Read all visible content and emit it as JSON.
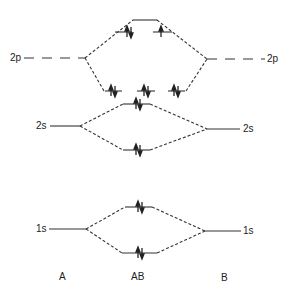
{
  "diagram": {
    "type": "molecular-orbital-energy-diagram",
    "columns": {
      "left": "A",
      "middle": "AB",
      "right": "B"
    },
    "atomic_orbitals": {
      "left": [
        {
          "label": "2p"
        },
        {
          "label": "2s"
        },
        {
          "label": "1s"
        }
      ],
      "right": [
        {
          "label": "2p"
        },
        {
          "label": "2s"
        },
        {
          "label": "1s"
        }
      ]
    },
    "molecular_orbitals": [
      {
        "name": "sigma-star-2p",
        "electrons": 0
      },
      {
        "name": "pi-star-2p-a",
        "electrons": 2
      },
      {
        "name": "pi-star-2p-b",
        "electrons": 1
      },
      {
        "name": "pi-2p-a",
        "electrons": 2
      },
      {
        "name": "sigma-2p",
        "electrons": 2
      },
      {
        "name": "pi-2p-b",
        "electrons": 2
      },
      {
        "name": "sigma-star-2s",
        "electrons": 2
      },
      {
        "name": "sigma-2s",
        "electrons": 2
      },
      {
        "name": "sigma-star-1s",
        "electrons": 2
      },
      {
        "name": "sigma-1s",
        "electrons": 2
      }
    ],
    "line_color": "#333333"
  }
}
